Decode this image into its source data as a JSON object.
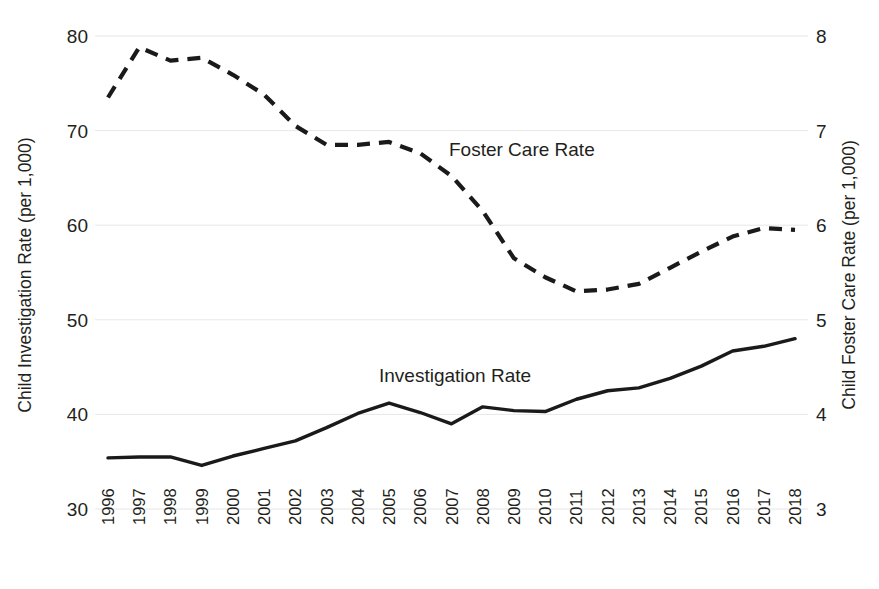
{
  "chart_data": {
    "type": "line",
    "title": "",
    "subtitle": "",
    "xlabel": "",
    "ylabel": "Child Investigation Rate (per 1,000)",
    "y2label": "Child Foster Care Rate (per 1,000)",
    "grid": true,
    "legend_position": "inline-annotations",
    "x": [
      1996,
      1997,
      1998,
      1999,
      2000,
      2001,
      2002,
      2003,
      2004,
      2005,
      2006,
      2007,
      2008,
      2009,
      2010,
      2011,
      2012,
      2013,
      2014,
      2015,
      2016,
      2017,
      2018
    ],
    "categories": [
      "1996",
      "1997",
      "1998",
      "1999",
      "2000",
      "2001",
      "2002",
      "2003",
      "2004",
      "2005",
      "2006",
      "2007",
      "2008",
      "2009",
      "2010",
      "2011",
      "2012",
      "2013",
      "2014",
      "2015",
      "2016",
      "2017",
      "2018"
    ],
    "ylim": [
      30,
      80
    ],
    "yticks": [
      30,
      40,
      50,
      60,
      70,
      80
    ],
    "ytick_labels": [
      "30",
      "40",
      "50",
      "60",
      "70",
      "80"
    ],
    "y2lim": [
      3,
      8
    ],
    "y2ticks": [
      3,
      4,
      5,
      6,
      7,
      8
    ],
    "y2tick_labels": [
      "3",
      "4",
      "5",
      "6",
      "7",
      "8"
    ],
    "series": [
      {
        "name": "Investigation Rate",
        "axis": "left",
        "style": "solid",
        "color": "#1a1a1a",
        "values": [
          35.4,
          35.5,
          35.5,
          34.6,
          35.6,
          36.4,
          37.2,
          38.6,
          40.1,
          41.2,
          40.2,
          39.0,
          40.8,
          40.4,
          40.3,
          41.6,
          42.5,
          42.8,
          43.8,
          45.1,
          46.7,
          47.2,
          48.0
        ]
      },
      {
        "name": "Foster Care Rate",
        "axis": "right",
        "style": "dashed",
        "color": "#1a1a1a",
        "values": [
          7.35,
          7.88,
          7.74,
          7.77,
          7.59,
          7.38,
          7.05,
          6.85,
          6.85,
          6.88,
          6.76,
          6.52,
          6.15,
          5.65,
          5.45,
          5.3,
          5.32,
          5.38,
          5.55,
          5.72,
          5.88,
          5.97,
          5.95
        ]
      }
    ],
    "annotations": [
      {
        "text": "Foster Care Rate",
        "x_px": 449,
        "y_px": 156
      },
      {
        "text": "Investigation Rate",
        "x_px": 379,
        "y_px": 382
      }
    ]
  }
}
